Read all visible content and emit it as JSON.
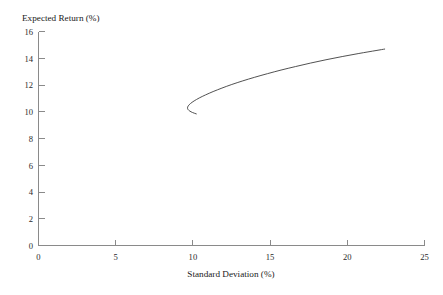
{
  "figure": {
    "background_color": "#ffffff",
    "axis_color": "#8a8a8a",
    "curve_color": "#3d3d3d",
    "text_color": "#1a1a1a"
  },
  "labels": {
    "y_axis_title": "Expected Return (%)",
    "x_axis_title": "Standard Deviation (%)"
  },
  "chart_data": {
    "type": "line",
    "title": "",
    "subtitle": "",
    "xlabel": "Standard Deviation (%)",
    "ylabel": "Expected Return (%)",
    "xlim": [
      0,
      25
    ],
    "ylim": [
      0,
      16
    ],
    "xticks": [
      0,
      5,
      10,
      15,
      20,
      25
    ],
    "yticks": [
      0,
      2,
      4,
      6,
      8,
      10,
      12,
      14,
      16
    ],
    "xtick_labels": [
      "0",
      "5",
      "10",
      "15",
      "20",
      "25"
    ],
    "ytick_labels": [
      "0",
      "2",
      "4",
      "6",
      "8",
      "10",
      "12",
      "14",
      "16"
    ],
    "grid": false,
    "legend": false,
    "legend_position": "none",
    "annotations": [],
    "series": [
      {
        "name": "Minimum-variance frontier",
        "description": "Backward-bending hyperbola (portfolio frontier); upper branch is the efficient frontier, lower branch is inefficient",
        "x": [
          10.22,
          9.98,
          9.8,
          9.69,
          9.65,
          9.7,
          9.84,
          10.08,
          10.41,
          10.82,
          11.31,
          11.88,
          12.52,
          13.23,
          14.0,
          14.83,
          15.71,
          16.64,
          17.61,
          18.62,
          19.67,
          20.75,
          21.86,
          22.42
        ],
        "y": [
          9.85,
          9.95,
          10.06,
          10.17,
          10.3,
          10.45,
          10.62,
          10.82,
          11.04,
          11.27,
          11.52,
          11.78,
          12.05,
          12.32,
          12.59,
          12.86,
          13.13,
          13.39,
          13.65,
          13.9,
          14.14,
          14.37,
          14.59,
          14.7
        ]
      }
    ]
  }
}
